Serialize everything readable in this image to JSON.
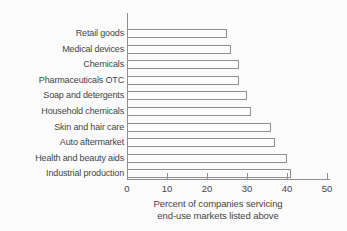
{
  "chart_data": {
    "type": "bar",
    "orientation": "horizontal",
    "title": "",
    "categories": [
      "Retail goods",
      "Medical devices",
      "Chemicals",
      "Pharmaceuticals OTC",
      "Soap and detergents",
      "Household chemicals",
      "Skin and hair care",
      "Auto aftermarket",
      "Health and beauty aids",
      "Industrial production"
    ],
    "values": [
      25,
      26,
      28,
      28,
      30,
      31,
      36,
      37,
      40,
      41
    ],
    "xlabel": "Percent of companies servicing end-use markets listed above",
    "xlabel_lines": [
      "Percent of companies servicing",
      "end-use markets listed above"
    ],
    "xlim": [
      0,
      50
    ],
    "xticks": [
      0,
      10,
      20,
      30,
      40,
      50
    ],
    "grid": false,
    "legend": "none",
    "bar_fill": "#fdfdfd",
    "bar_outline": "#8e8e8e",
    "axis_color": "#8e8e8e",
    "text_color": "#454545",
    "background": "#fbfbfb"
  }
}
